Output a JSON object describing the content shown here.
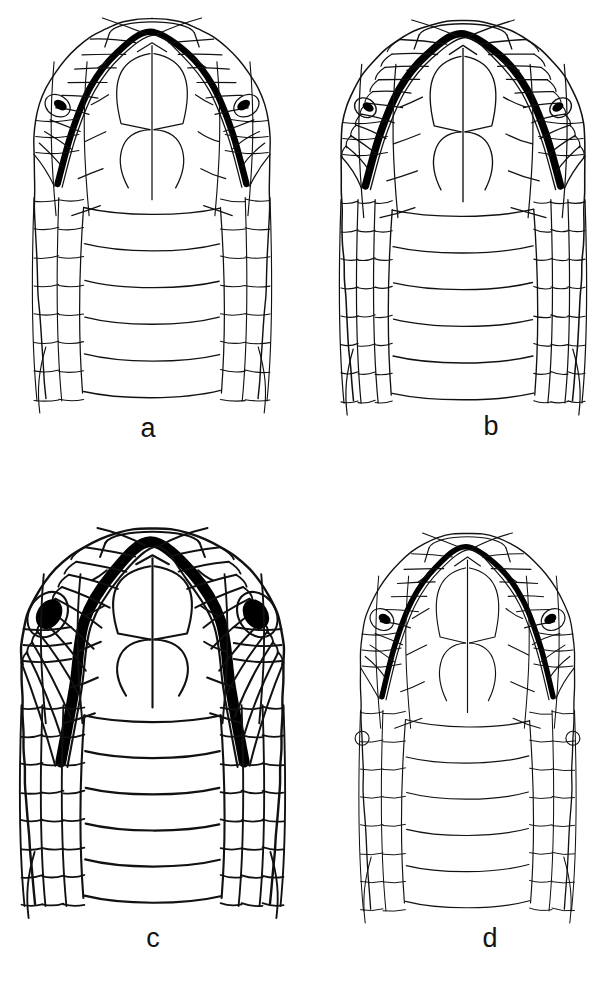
{
  "figure": {
    "type": "scientific-illustration",
    "background_color": "#ffffff",
    "ink_color": "#111111",
    "canvas": {
      "width": 608,
      "height": 996
    }
  },
  "panels": [
    {
      "id": "a",
      "label": "a",
      "label_x": 128,
      "label_y": 415,
      "origin_x": 12,
      "origin_y": 10,
      "width": 280,
      "height": 395,
      "line_weight": 1.25,
      "mouth_weight": 6.5,
      "eye_style": "small-sliver",
      "eye_rx": 7,
      "eye_ry": 4.5,
      "head_width": 236,
      "snout_width": 86,
      "ventral_bands": 5,
      "lateral_columns": 2,
      "cropped": false,
      "jaw_bump": false
    },
    {
      "id": "b",
      "label": "b",
      "label_x": 471,
      "label_y": 413,
      "origin_x": 318,
      "origin_y": 12,
      "width": 290,
      "height": 395,
      "line_weight": 1.35,
      "mouth_weight": 7.5,
      "eye_style": "small-sliver",
      "eye_rx": 6,
      "eye_ry": 4,
      "head_width": 244,
      "snout_width": 80,
      "ventral_bands": 5,
      "lateral_columns": 3,
      "cropped": true,
      "jaw_bump": false
    },
    {
      "id": "c",
      "label": "c",
      "label_x": 133,
      "label_y": 925,
      "origin_x": 10,
      "origin_y": 520,
      "width": 285,
      "height": 390,
      "line_weight": 2.1,
      "mouth_weight": 11,
      "eye_style": "large-oval",
      "eye_rx": 12,
      "eye_ry": 16,
      "head_width": 262,
      "snout_width": 96,
      "ventral_bands": 5,
      "lateral_columns": 3,
      "cropped": false,
      "jaw_bump": false
    },
    {
      "id": "d",
      "label": "d",
      "label_x": 470,
      "label_y": 925,
      "origin_x": 330,
      "origin_y": 525,
      "width": 275,
      "height": 390,
      "line_weight": 1.15,
      "mouth_weight": 5.5,
      "eye_style": "small-sliver",
      "eye_rx": 6.5,
      "eye_ry": 4.5,
      "head_width": 214,
      "snout_width": 76,
      "ventral_bands": 5,
      "lateral_columns": 2,
      "cropped": false,
      "jaw_bump": true
    }
  ],
  "anatomy": {
    "structures": [
      "rostral",
      "mental",
      "anterior chin shields",
      "posterior chin shields",
      "infralabials",
      "gular scales",
      "ventral plates"
    ]
  }
}
